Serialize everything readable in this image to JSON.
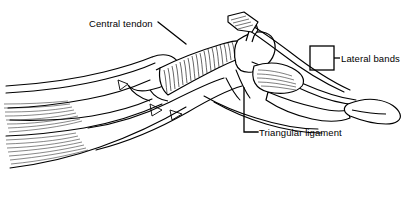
{
  "figure": {
    "background_color": "#ffffff",
    "line_color": "#000000",
    "width": 412,
    "height": 202
  },
  "labels": {
    "central_tendon": "Central tendon",
    "lateral_bands": "Lateral bands",
    "triangular_ligament": "Triangular ligament"
  },
  "annotations": {
    "central_tendon_leader": "diagonal-leader-line",
    "lateral_bands_bracket": "rectangle-bracket",
    "triangular_ligament_leader": "elbow-leader-line"
  }
}
